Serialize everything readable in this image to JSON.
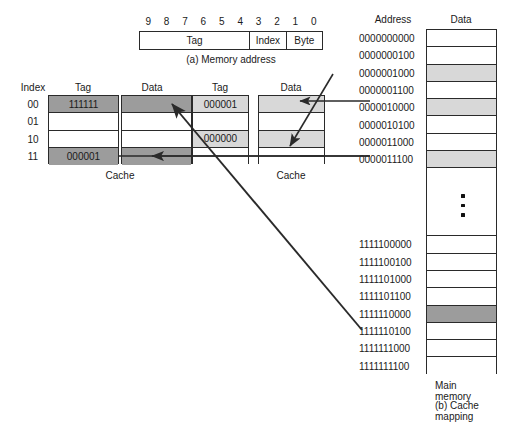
{
  "figure": {
    "part_a_caption": "(a) Memory address",
    "part_b_caption": "(b) Cache mapping",
    "main_memory_label": "Main memory"
  },
  "address_bar": {
    "bit_numbers": [
      "9",
      "8",
      "7",
      "6",
      "5",
      "4",
      "3",
      "2",
      "1",
      "0"
    ],
    "fields": [
      {
        "label": "Tag",
        "bits": 6
      },
      {
        "label": "Index",
        "bits": 2
      },
      {
        "label": "Byte",
        "bits": 2
      }
    ]
  },
  "cache_left": {
    "label": "Cache",
    "headers": {
      "index": "Index",
      "tag": "Tag",
      "data": "Data"
    },
    "rows": [
      {
        "index": "00",
        "tag": "111111",
        "data": "",
        "shade": "dark"
      },
      {
        "index": "01",
        "tag": "",
        "data": "",
        "shade": "none"
      },
      {
        "index": "10",
        "tag": "",
        "data": "",
        "shade": "none"
      },
      {
        "index": "11",
        "tag": "000001",
        "data": "",
        "shade": "dark"
      }
    ]
  },
  "cache_right": {
    "label": "Cache",
    "headers": {
      "tag": "Tag",
      "data": "Data"
    },
    "rows": [
      {
        "tag": "000001",
        "data": "",
        "shade": "light"
      },
      {
        "tag": "",
        "data": "",
        "shade": "none"
      },
      {
        "tag": "000000",
        "data": "",
        "shade": "light"
      },
      {
        "tag": "",
        "data": "",
        "shade": "none"
      }
    ]
  },
  "main_memory": {
    "headers": {
      "address": "Address",
      "data": "Data"
    },
    "ellipsis": "vertical-dots",
    "rows_top": [
      {
        "address": "0000000000",
        "shade": "none"
      },
      {
        "address": "0000000100",
        "shade": "none"
      },
      {
        "address": "0000001000",
        "shade": "light"
      },
      {
        "address": "0000001100",
        "shade": "none"
      },
      {
        "address": "0000010000",
        "shade": "light"
      },
      {
        "address": "0000010100",
        "shade": "none"
      },
      {
        "address": "0000011000",
        "shade": "none"
      },
      {
        "address": "0000011100",
        "shade": "light"
      }
    ],
    "rows_bottom": [
      {
        "address": "1111100000",
        "shade": "none"
      },
      {
        "address": "1111100100",
        "shade": "none"
      },
      {
        "address": "1111101000",
        "shade": "none"
      },
      {
        "address": "1111101100",
        "shade": "none"
      },
      {
        "address": "1111110000",
        "shade": "dark"
      },
      {
        "address": "1111110100",
        "shade": "none"
      },
      {
        "address": "1111111000",
        "shade": "none"
      },
      {
        "address": "1111111100",
        "shade": "none"
      }
    ]
  },
  "colors": {
    "line": "#2a2a2a",
    "shade_dark": "#9c9c9c",
    "shade_light": "#d8d8d8",
    "background": "#ffffff",
    "text": "#1a1a1a"
  }
}
